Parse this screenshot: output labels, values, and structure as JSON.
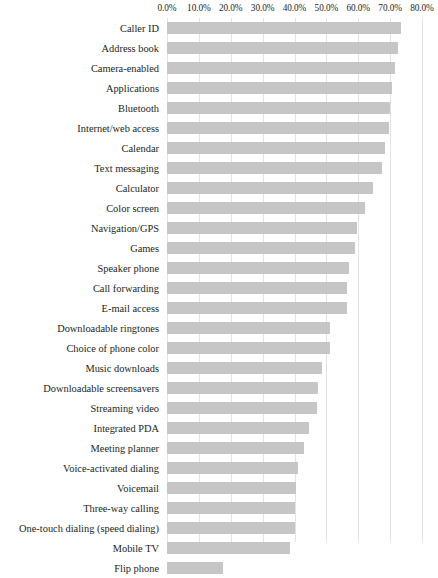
{
  "chart_data": {
    "type": "bar",
    "orientation": "horizontal",
    "title": "",
    "subtitle": "",
    "xlabel": "",
    "ylabel": "",
    "xlim": [
      0,
      80
    ],
    "xtick_labels": [
      "0.0%",
      "10.0%",
      "20.0%",
      "30.0%",
      "40.0%",
      "50.0%",
      "60.0%",
      "70.0%",
      "80.0%"
    ],
    "xticks": [
      0,
      10,
      20,
      30,
      40,
      50,
      60,
      70,
      80
    ],
    "grid": true,
    "legend": false,
    "bar_color": "#c6c6c6",
    "categories": [
      "Caller ID",
      "Address book",
      "Camera-enabled",
      "Applications",
      "Bluetooth",
      "Internet/web access",
      "Calendar",
      "Text messaging",
      "Calculator",
      "Color screen",
      "Navigation/GPS",
      "Games",
      "Speaker phone",
      "Call forwarding",
      "E-mail access",
      "Downloadable ringtones",
      "Choice of phone color",
      "Music downloads",
      "Downloadable screensavers",
      "Streaming video",
      "Integrated PDA",
      "Meeting planner",
      "Voice-activated dialing",
      "Voicemail",
      "Three-way calling",
      "One-touch dialing (speed dialing)",
      "Mobile TV",
      "Flip phone"
    ],
    "values": [
      73.5,
      72.5,
      71.5,
      70.5,
      70.0,
      69.5,
      68.5,
      67.5,
      64.5,
      62.0,
      59.5,
      59.0,
      57.0,
      56.5,
      56.5,
      51.0,
      51.0,
      48.5,
      47.5,
      47.0,
      44.5,
      43.0,
      41.0,
      40.5,
      40.0,
      40.0,
      38.7,
      17.5
    ]
  }
}
